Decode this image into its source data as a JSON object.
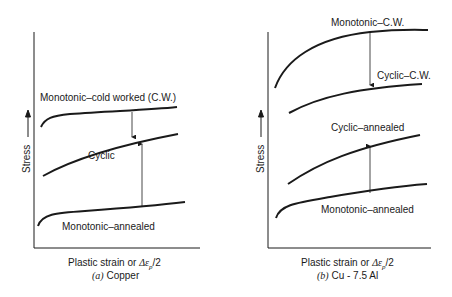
{
  "panels": [
    {
      "id": "a",
      "ylabel": "Stress",
      "xlabel_prefix": "Plastic strain or ",
      "xlabel_symbol": "Δε",
      "xlabel_sub": "p",
      "xlabel_suffix": "/2",
      "caption_letter": "(a)",
      "caption_text": " Copper",
      "curves": {
        "mono_cw": "Monotonic–cold worked (C.W.)",
        "cyclic": "Cyclic",
        "mono_annealed": "Monotonic–annealed"
      }
    },
    {
      "id": "b",
      "ylabel": "Stress",
      "xlabel_prefix": "Plastic strain or ",
      "xlabel_symbol": "Δε",
      "xlabel_sub": "p",
      "xlabel_suffix": "/2",
      "caption_letter": "(b)",
      "caption_text": " Cu - 7.5 Al",
      "curves": {
        "mono_cw": "Monotonic–C.W.",
        "cyclic_cw": "Cyclic–C.W.",
        "cyclic_annealed": "Cyclic–annealed",
        "mono_annealed": "Monotonic–annealed"
      }
    }
  ]
}
